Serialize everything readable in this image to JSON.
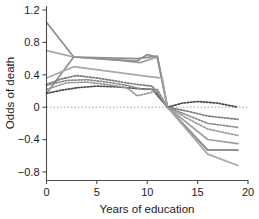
{
  "chart_data": {
    "type": "line",
    "title": "",
    "xlabel": "Years of education",
    "ylabel": "Odds of death",
    "xlim": [
      0,
      20
    ],
    "ylim": [
      -0.9,
      1.25
    ],
    "xticks": [
      0,
      5,
      10,
      15,
      20
    ],
    "xtick_labels": [
      "0",
      "5",
      "10",
      "15",
      "20"
    ],
    "yticks": [
      1.2,
      0.8,
      0.4,
      0,
      -0.4,
      -0.8
    ],
    "ytick_labels": [
      "1.2",
      "0.8",
      "0.4",
      "0",
      "−0.4",
      "−0.8"
    ],
    "grid": false,
    "legend": "none",
    "reference_line": {
      "y": 0,
      "style": "dotted",
      "color": "#9a9a9a"
    },
    "series": [
      {
        "name": "solid-1",
        "style": "solid",
        "color": "#8c8c8c",
        "x": [
          0,
          2.7,
          9,
          11,
          12,
          16,
          19
        ],
        "values": [
          1.05,
          0.62,
          0.6,
          0.63,
          0.0,
          -0.53,
          -0.53
        ]
      },
      {
        "name": "solid-2",
        "style": "solid",
        "color": "#9e9e9e",
        "x": [
          0,
          2.7,
          7,
          9.3,
          11,
          12,
          16,
          19
        ],
        "values": [
          0.7,
          0.62,
          0.58,
          0.55,
          0.62,
          0.0,
          -0.4,
          -0.45
        ]
      },
      {
        "name": "solid-3",
        "style": "solid",
        "color": "#8f8f8f",
        "x": [
          0,
          2.7,
          9,
          10,
          11,
          12,
          16,
          19
        ],
        "values": [
          0.17,
          0.62,
          0.57,
          0.65,
          0.62,
          0.0,
          -0.53,
          -0.53
        ]
      },
      {
        "name": "solid-4",
        "style": "solid",
        "color": "#a8a8a8",
        "x": [
          0,
          2.7,
          10,
          11.5,
          12,
          16,
          19
        ],
        "values": [
          0.36,
          0.5,
          0.38,
          0.36,
          0.0,
          -0.58,
          -0.72
        ]
      },
      {
        "name": "dotted-1",
        "style": "dotted",
        "color": "#4a4a4a",
        "x": [
          0,
          1.5,
          3,
          5,
          7,
          9,
          10.5,
          12,
          13.5,
          15,
          17,
          19
        ],
        "values": [
          0.17,
          0.21,
          0.24,
          0.26,
          0.25,
          0.23,
          0.22,
          0.0,
          0.05,
          0.07,
          0.05,
          0.0
        ]
      },
      {
        "name": "dotted-2",
        "style": "dotted",
        "color": "#7a7a7a",
        "x": [
          0,
          1.5,
          3,
          5,
          7,
          9,
          10.5,
          12,
          14,
          16,
          19
        ],
        "values": [
          0.28,
          0.35,
          0.39,
          0.36,
          0.32,
          0.28,
          0.26,
          0.0,
          -0.05,
          -0.11,
          -0.15
        ]
      },
      {
        "name": "dotted-3",
        "style": "dotted",
        "color": "#8a8a8a",
        "x": [
          0,
          2,
          4,
          6,
          8,
          9.5,
          11,
          12,
          14,
          16,
          19
        ],
        "values": [
          0.27,
          0.33,
          0.34,
          0.31,
          0.27,
          0.22,
          0.22,
          0.0,
          -0.1,
          -0.2,
          -0.25
        ]
      },
      {
        "name": "dotted-4",
        "style": "dotted",
        "color": "#9a9a9a",
        "x": [
          0,
          2,
          4,
          6,
          8,
          9,
          10,
          11,
          12,
          14,
          16,
          19
        ],
        "values": [
          0.22,
          0.3,
          0.31,
          0.28,
          0.24,
          0.14,
          0.17,
          0.2,
          0.0,
          -0.14,
          -0.27,
          -0.35
        ]
      }
    ]
  }
}
